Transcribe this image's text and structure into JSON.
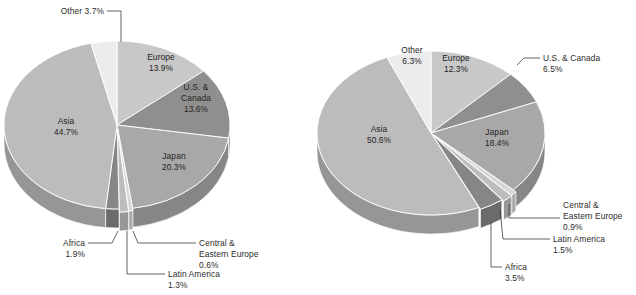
{
  "figure": {
    "background": "#ffffff",
    "width": 636,
    "height": 295
  },
  "chart_data": [
    {
      "type": "pie",
      "id": "left-pie",
      "title": "",
      "style": "3d-exploded",
      "legend": "none",
      "labels_inline": true,
      "categories": [
        "Europe",
        "U.S. & Canada",
        "Japan",
        "Central & Eastern Europe",
        "Latin America",
        "Africa",
        "Asia",
        "Other"
      ],
      "values": [
        13.9,
        13.6,
        20.3,
        0.6,
        1.3,
        1.9,
        44.7,
        3.7
      ],
      "slices": [
        {
          "label": "Europe",
          "value_text": "13.9%",
          "value": 13.9,
          "color": "#c8c8c8",
          "label_position": "inside"
        },
        {
          "label": "U.S. & Canada",
          "value_text": "13.6%",
          "value": 13.6,
          "color": "#8f8f8f",
          "label_position": "inside"
        },
        {
          "label": "Japan",
          "value_text": "20.3%",
          "value": 20.3,
          "color": "#a8a8a8",
          "label_position": "inside"
        },
        {
          "label": "Central & Eastern Europe",
          "value_text": "0.6%",
          "value": 0.6,
          "color": "#d6d6d6",
          "label_position": "callout"
        },
        {
          "label": "Latin America",
          "value_text": "1.3%",
          "value": 1.3,
          "color": "#bdbdbd",
          "label_position": "callout"
        },
        {
          "label": "Africa",
          "value_text": "1.9%",
          "value": 1.9,
          "color": "#868686",
          "label_position": "callout"
        },
        {
          "label": "Asia",
          "value_text": "44.7%",
          "value": 44.7,
          "color": "#bcbcbc",
          "label_position": "inside"
        },
        {
          "label": "Other",
          "value_text": "3.7%",
          "value": 3.7,
          "color": "#ececec",
          "label_position": "callout"
        }
      ]
    },
    {
      "type": "pie",
      "id": "right-pie",
      "title": "",
      "style": "3d-exploded",
      "legend": "none",
      "labels_inline": true,
      "categories": [
        "Europe",
        "U.S. & Canada",
        "Japan",
        "Central & Eastern Europe",
        "Latin America",
        "Africa",
        "Asia",
        "Other"
      ],
      "values": [
        12.3,
        6.5,
        18.4,
        0.9,
        1.5,
        3.5,
        50.6,
        6.3
      ],
      "slices": [
        {
          "label": "Europe",
          "value_text": "12.3%",
          "value": 12.3,
          "color": "#c8c8c8",
          "label_position": "inside"
        },
        {
          "label": "U.S. & Canada",
          "value_text": "6.5%",
          "value": 6.5,
          "color": "#8f8f8f",
          "label_position": "callout"
        },
        {
          "label": "Japan",
          "value_text": "18.4%",
          "value": 18.4,
          "color": "#a8a8a8",
          "label_position": "inside"
        },
        {
          "label": "Central & Eastern Europe",
          "value_text": "0.9%",
          "value": 0.9,
          "color": "#d6d6d6",
          "label_position": "callout"
        },
        {
          "label": "Latin America",
          "value_text": "1.5%",
          "value": 1.5,
          "color": "#bdbdbd",
          "label_position": "callout"
        },
        {
          "label": "Africa",
          "value_text": "3.5%",
          "value": 3.5,
          "color": "#868686",
          "label_position": "callout"
        },
        {
          "label": "Asia",
          "value_text": "50.6%",
          "value": 50.6,
          "color": "#bcbcbc",
          "label_position": "inside"
        },
        {
          "label": "Other",
          "value_text": "6.3%",
          "value": 6.3,
          "color": "#ececec",
          "label_position": "inside"
        }
      ]
    }
  ],
  "left_chart": {
    "labels": {
      "other_name": "Other 3.7%",
      "europe_name": "Europe",
      "europe_value": "13.9%",
      "us_name_1": "U.S. &",
      "us_name_2": "Canada",
      "us_value": "13.6%",
      "japan_name": "Japan",
      "japan_value": "20.3%",
      "asia_name": "Asia",
      "asia_value": "44.7%",
      "africa_name": "Africa",
      "africa_value": "1.9%",
      "cee_name_1": "Central &",
      "cee_name_2": "Eastern Europe",
      "cee_value": "0.6%",
      "latam_name": "Latin America",
      "latam_value": "1.3%"
    }
  },
  "right_chart": {
    "labels": {
      "other_name": "Other",
      "other_value": "6.3%",
      "europe_name": "Europe",
      "europe_value": "12.3%",
      "us_name": "U.S. & Canada",
      "us_value": "6.5%",
      "japan_name": "Japan",
      "japan_value": "18.4%",
      "asia_name": "Asia",
      "asia_value": "50.6%",
      "cee_name_1": "Central &",
      "cee_name_2": "Eastern Europe",
      "cee_value": "0.9%",
      "latam_name": "Latin America",
      "latam_value": "1.5%",
      "africa_name": "Africa",
      "africa_value": "3.5%"
    }
  }
}
